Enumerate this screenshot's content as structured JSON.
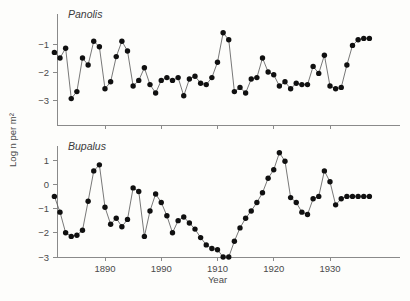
{
  "figure": {
    "background_color": "#fdfdfb",
    "marker_color": "#101010",
    "line_color": "#555555",
    "axis_color": "#8a8a8a",
    "xlabel": "Year",
    "ylabel": "Log n per m²",
    "x_tick_labels": [
      "1890",
      "1990",
      "1910",
      "1920",
      "1930"
    ],
    "x_tick_values": [
      1890,
      1900,
      1910,
      1920,
      1930
    ]
  },
  "chart_data": [
    {
      "type": "line",
      "title": "Panolis",
      "xlabel": "Year",
      "ylabel": "Log n per m²",
      "xlim": [
        1880,
        1938
      ],
      "ylim": [
        -3.6,
        -0.2
      ],
      "yticks": [
        -1,
        -2,
        -3
      ],
      "ytick_labels": [
        "−1",
        "−2",
        "−3"
      ],
      "xticks": [
        1890,
        1900,
        1910,
        1920,
        1930
      ],
      "xtick_labels": [
        "1890",
        "1990",
        "1910",
        "1920",
        "1930"
      ],
      "grid": false,
      "legend": "none",
      "marker": "filled-circle",
      "x": [
        1881,
        1882,
        1883,
        1884,
        1885,
        1886,
        1887,
        1888,
        1889,
        1890,
        1891,
        1892,
        1893,
        1894,
        1895,
        1896,
        1897,
        1898,
        1899,
        1900,
        1901,
        1902,
        1903,
        1904,
        1905,
        1906,
        1907,
        1908,
        1909,
        1910,
        1911,
        1912,
        1913,
        1914,
        1915,
        1916,
        1917,
        1918,
        1919,
        1920,
        1921,
        1922,
        1923,
        1924,
        1925,
        1926,
        1927,
        1928,
        1929,
        1930,
        1931,
        1932,
        1933,
        1934,
        1935,
        1936,
        1937
      ],
      "y": [
        -1.3,
        -1.5,
        -1.15,
        -2.95,
        -2.7,
        -1.5,
        -1.75,
        -0.9,
        -1.1,
        -2.6,
        -2.35,
        -1.45,
        -0.9,
        -1.25,
        -2.5,
        -2.3,
        -1.85,
        -2.45,
        -2.75,
        -2.3,
        -2.2,
        -2.3,
        -2.2,
        -2.85,
        -2.25,
        -2.15,
        -2.4,
        -2.45,
        -2.2,
        -1.65,
        -0.6,
        -0.85,
        -2.7,
        -2.55,
        -2.75,
        -2.25,
        -2.2,
        -1.5,
        -2.0,
        -2.1,
        -2.5,
        -2.35,
        -2.6,
        -2.4,
        -2.45,
        -2.45,
        -1.8,
        -2.05,
        -1.4,
        -2.5,
        -2.6,
        -2.55,
        -1.75,
        -1.05,
        -0.85,
        -0.8,
        -0.8
      ],
      "series": [
        {
          "name": "Panolis",
          "values": [
            -1.3,
            -1.5,
            -1.15,
            -2.95,
            -2.7,
            -1.5,
            -1.75,
            -0.9,
            -1.1,
            -2.6,
            -2.35,
            -1.45,
            -0.9,
            -1.25,
            -2.5,
            -2.3,
            -1.85,
            -2.45,
            -2.75,
            -2.3,
            -2.2,
            -2.3,
            -2.2,
            -2.85,
            -2.25,
            -2.15,
            -2.4,
            -2.45,
            -2.2,
            -1.65,
            -0.6,
            -0.85,
            -2.7,
            -2.55,
            -2.75,
            -2.25,
            -2.2,
            -1.5,
            -2.0,
            -2.1,
            -2.5,
            -2.35,
            -2.6,
            -2.4,
            -2.45,
            -2.45,
            -1.8,
            -2.05,
            -1.4,
            -2.5,
            -2.6,
            -2.55,
            -1.75,
            -1.05,
            -0.85,
            -0.8,
            -0.8
          ]
        }
      ]
    },
    {
      "type": "line",
      "title": "Bupalus",
      "xlabel": "Year",
      "ylabel": "Log n per m²",
      "xlim": [
        1880,
        1938
      ],
      "ylim": [
        -3.0,
        1.6
      ],
      "yticks": [
        1,
        0,
        -1,
        -2,
        -3
      ],
      "ytick_labels": [
        "1",
        "0",
        "−1",
        "−2",
        "−3"
      ],
      "xticks": [
        1890,
        1900,
        1910,
        1920,
        1930
      ],
      "xtick_labels": [
        "1890",
        "1990",
        "1910",
        "1920",
        "1930"
      ],
      "grid": false,
      "legend": "none",
      "marker": "filled-circle",
      "x": [
        1881,
        1882,
        1883,
        1884,
        1885,
        1886,
        1887,
        1888,
        1889,
        1890,
        1891,
        1892,
        1893,
        1894,
        1895,
        1896,
        1897,
        1898,
        1899,
        1900,
        1901,
        1902,
        1903,
        1904,
        1905,
        1906,
        1907,
        1908,
        1909,
        1910,
        1911,
        1912,
        1913,
        1914,
        1915,
        1916,
        1917,
        1918,
        1919,
        1920,
        1921,
        1922,
        1923,
        1924,
        1925,
        1926,
        1927,
        1928,
        1929,
        1930,
        1931,
        1932,
        1933,
        1934,
        1935,
        1936,
        1937
      ],
      "y": [
        -0.5,
        -1.15,
        -2.0,
        -2.15,
        -2.1,
        -1.9,
        -0.7,
        0.55,
        0.8,
        -0.95,
        -1.65,
        -1.4,
        -1.75,
        -1.45,
        -0.15,
        -0.3,
        -2.15,
        -1.1,
        -0.4,
        -0.75,
        -1.3,
        -2.0,
        -1.5,
        -1.35,
        -1.6,
        -1.85,
        -2.2,
        -2.5,
        -2.65,
        -2.7,
        -3.0,
        -3.0,
        -2.35,
        -1.8,
        -1.4,
        -1.1,
        -0.75,
        -0.35,
        0.25,
        0.6,
        1.3,
        0.95,
        -0.55,
        -0.75,
        -1.15,
        -1.25,
        -0.6,
        -0.5,
        0.55,
        0.1,
        -0.85,
        -0.6,
        -0.5,
        -0.5,
        -0.5,
        -0.5,
        -0.5
      ],
      "series": [
        {
          "name": "Bupalus",
          "values": [
            -0.5,
            -1.15,
            -2.0,
            -2.15,
            -2.1,
            -1.9,
            -0.7,
            0.55,
            0.8,
            -0.95,
            -1.65,
            -1.4,
            -1.75,
            -1.45,
            -0.15,
            -0.3,
            -2.15,
            -1.1,
            -0.4,
            -0.75,
            -1.3,
            -2.0,
            -1.5,
            -1.35,
            -1.6,
            -1.85,
            -2.2,
            -2.5,
            -2.65,
            -2.7,
            -3.0,
            -3.0,
            -2.35,
            -1.8,
            -1.4,
            -1.1,
            -0.75,
            -0.35,
            0.25,
            0.6,
            1.3,
            0.95,
            -0.55,
            -0.75,
            -1.15,
            -1.25,
            -0.6,
            -0.5,
            0.55,
            0.1,
            -0.85,
            -0.6,
            -0.5,
            -0.5,
            -0.5,
            -0.5,
            -0.5
          ]
        }
      ]
    }
  ]
}
